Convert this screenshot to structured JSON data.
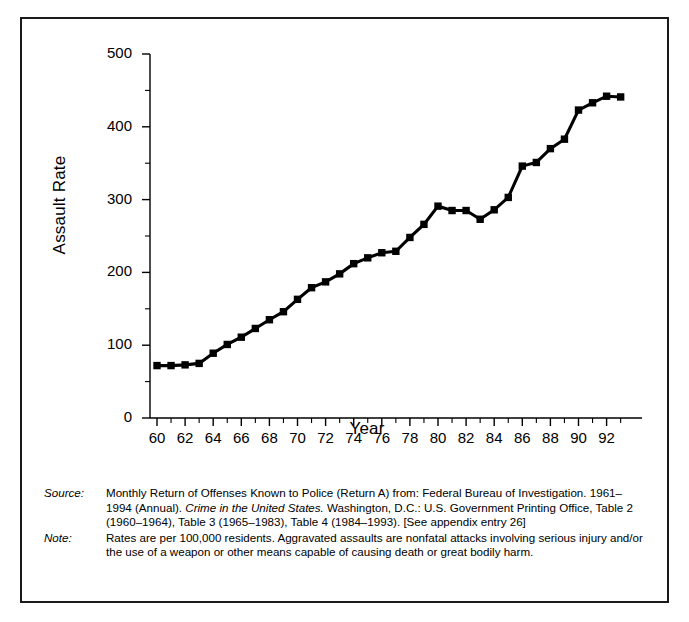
{
  "figure": {
    "y_axis_title": "Assault Rate",
    "x_axis_title": "Year",
    "y_tick_labels": [
      "500",
      "400",
      "300",
      "200",
      "100",
      "0"
    ],
    "x_tick_labels": [
      "60",
      "62",
      "64",
      "66",
      "68",
      "70",
      "72",
      "74",
      "76",
      "78",
      "80",
      "82",
      "84",
      "86",
      "88",
      "90",
      "92"
    ],
    "series_color": "#000000"
  },
  "notes": {
    "source_label": "Source:",
    "source_text_1": "Monthly Return of Offenses Known to Police (Return A) from:  Federal Bureau of Investigation. 1961–1994 (Annual). ",
    "source_text_italic": "Crime in the United States.",
    "source_text_2": " Washington, D.C.: U.S. Government Printing Office, Table 2 (1960–1964), Table 3 (1965–1983), Table 4 (1984–1993). [See appendix entry 26]",
    "note_label": "Note:",
    "note_text": "Rates are per 100,000 residents.  Aggravated assaults are nonfatal attacks involving serious injury and/or the use of a weapon or other means capable of causing death or great bodily harm."
  },
  "chart_data": {
    "type": "line",
    "title": "",
    "xlabel": "Year",
    "ylabel": "Assault Rate",
    "xlim": [
      1960,
      1993
    ],
    "ylim": [
      0,
      500
    ],
    "ytick_values": [
      0,
      100,
      200,
      300,
      400,
      500
    ],
    "yminor_tick_values": [
      50,
      150,
      250,
      350,
      450
    ],
    "xtick_values": [
      1960,
      1962,
      1964,
      1966,
      1968,
      1970,
      1972,
      1974,
      1976,
      1978,
      1980,
      1982,
      1984,
      1986,
      1988,
      1990,
      1992
    ],
    "grid": false,
    "legend": "none",
    "marker": "square",
    "x": [
      1960,
      1961,
      1962,
      1963,
      1964,
      1965,
      1966,
      1967,
      1968,
      1969,
      1970,
      1971,
      1972,
      1973,
      1974,
      1975,
      1976,
      1977,
      1978,
      1979,
      1980,
      1981,
      1982,
      1983,
      1984,
      1985,
      1986,
      1987,
      1988,
      1989,
      1990,
      1991,
      1992,
      1993
    ],
    "values": [
      72,
      72,
      73,
      75,
      89,
      101,
      111,
      123,
      135,
      146,
      163,
      179,
      187,
      198,
      212,
      220,
      227,
      229,
      248,
      266,
      291,
      285,
      285,
      273,
      286,
      303,
      346,
      351,
      370,
      383,
      423,
      433,
      442,
      441
    ],
    "series": [
      {
        "name": "Assault Rate",
        "values": [
          72,
          72,
          73,
          75,
          89,
          101,
          111,
          123,
          135,
          146,
          163,
          179,
          187,
          198,
          212,
          220,
          227,
          229,
          248,
          266,
          291,
          285,
          285,
          273,
          286,
          303,
          346,
          351,
          370,
          383,
          423,
          433,
          442,
          441
        ]
      }
    ]
  }
}
